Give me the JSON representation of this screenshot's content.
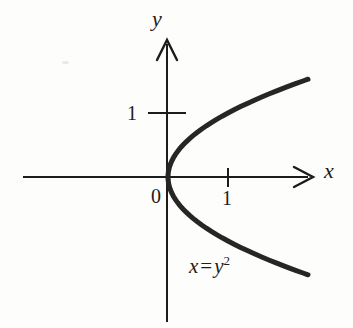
{
  "figure": {
    "background_color": "#fdfdfc",
    "ink_color": "#1c1c1c",
    "curve_color": "#262626"
  },
  "axes": {
    "x_axis": {
      "label": "x",
      "label_name": "x-axis-label",
      "arrow": "right",
      "tick_values": [
        1
      ],
      "tick_labels": [
        "1"
      ]
    },
    "y_axis": {
      "label": "y",
      "label_name": "y-axis-label",
      "arrow": "up",
      "tick_values": [
        1
      ],
      "tick_labels": [
        "1"
      ]
    },
    "origin_label": "0"
  },
  "annotations": {
    "equation": {
      "variable_left": "x",
      "equals": "=",
      "variable_right": "y",
      "exponent": "2",
      "full_text": "x = y2"
    }
  },
  "chart_data": {
    "type": "line",
    "title": "",
    "subtitle": "",
    "xlabel": "x",
    "ylabel": "y",
    "equation": "x = y^2",
    "grid": false,
    "legend": null,
    "xlim": [
      -2.4,
      2.4
    ],
    "ylim": [
      -2.25,
      2.15
    ],
    "xticks": [
      1
    ],
    "xticklabels": [
      "1"
    ],
    "yticks": [
      1
    ],
    "yticklabels": [
      "1"
    ],
    "origin_label": "0",
    "annotations": [
      {
        "text": "x = y2",
        "x": 0.37,
        "y": -1.45
      }
    ],
    "series": [
      {
        "name": "x = y^2 (upper branch)",
        "x": [
          0,
          0.0025,
          0.01,
          0.0225,
          0.04,
          0.0625,
          0.09,
          0.1225,
          0.16,
          0.2025,
          0.25,
          0.3025,
          0.36,
          0.4225,
          0.49,
          0.5625,
          0.64,
          0.7225,
          0.81,
          0.9025,
          1.0,
          1.1025,
          1.21,
          1.3225,
          1.44,
          1.5625,
          1.69,
          1.8225,
          1.96,
          2.1025,
          2.25,
          2.3333
        ],
        "y": [
          0,
          0.05,
          0.1,
          0.15,
          0.2,
          0.25,
          0.3,
          0.35,
          0.4,
          0.45,
          0.5,
          0.55,
          0.6,
          0.65,
          0.7,
          0.75,
          0.8,
          0.85,
          0.9,
          0.95,
          1.0,
          1.05,
          1.1,
          1.15,
          1.2,
          1.25,
          1.3,
          1.35,
          1.4,
          1.45,
          1.5,
          1.5276
        ]
      },
      {
        "name": "x = y^2 (lower branch)",
        "x": [
          0,
          0.0025,
          0.01,
          0.0225,
          0.04,
          0.0625,
          0.09,
          0.1225,
          0.16,
          0.2025,
          0.25,
          0.3025,
          0.36,
          0.4225,
          0.49,
          0.5625,
          0.64,
          0.7225,
          0.81,
          0.9025,
          1.0,
          1.1025,
          1.21,
          1.3225,
          1.44,
          1.5625,
          1.69,
          1.8225,
          1.96,
          2.1025,
          2.25,
          2.3333
        ],
        "y": [
          0,
          -0.05,
          -0.1,
          -0.15,
          -0.2,
          -0.25,
          -0.3,
          -0.35,
          -0.4,
          -0.45,
          -0.5,
          -0.55,
          -0.6,
          -0.65,
          -0.7,
          -0.75,
          -0.8,
          -0.85,
          -0.9,
          -0.95,
          -1.0,
          -1.05,
          -1.1,
          -1.15,
          -1.2,
          -1.25,
          -1.3,
          -1.35,
          -1.4,
          -1.45,
          -1.5,
          -1.5276
        ]
      }
    ]
  }
}
